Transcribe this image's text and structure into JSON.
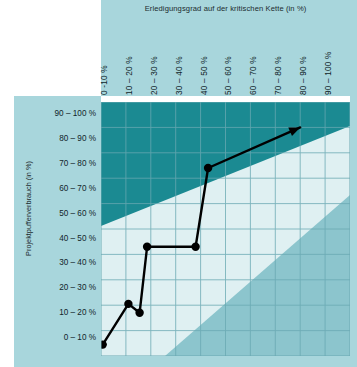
{
  "chart_data": {
    "type": "line",
    "title": "Erledigungsgrad auf der kritischen Kette (in %)",
    "xlabel": "Erledigungsgrad auf der kritischen Kette (in %)",
    "ylabel": "Projektpufferverbrauch (in %)",
    "grid": true,
    "legend": "none",
    "xlim": [
      0,
      100
    ],
    "ylim": [
      0,
      100
    ],
    "x_tick_labels": [
      "0 -10 %",
      "10 – 20 %",
      "20 – 30 %",
      "30 – 40 %",
      "40 – 50 %",
      "50 – 60 %",
      "60 – 70 %",
      "70 – 80 %",
      "80 – 90 %",
      "90 – 100 %"
    ],
    "y_tick_labels": [
      "90 – 100 %",
      "80 – 90 %",
      "70 – 80 %",
      "60 – 70 %",
      "50 – 60 %",
      "40 – 50 %",
      "30 – 40 %",
      "20 – 30 %",
      "10 – 20 %",
      "0 – 10 %"
    ],
    "series": [
      {
        "name": "Pufferverbrauch",
        "marker": "circle-filled",
        "arrow_end": true,
        "points": [
          {
            "x": 0.7,
            "y": 4.5
          },
          {
            "x": 11.0,
            "y": 20.5
          },
          {
            "x": 15.5,
            "y": 17.0
          },
          {
            "x": 18.5,
            "y": 43.0
          },
          {
            "x": 38.0,
            "y": 43.0
          },
          {
            "x": 43.0,
            "y": 74.0
          },
          {
            "x": 80.0,
            "y": 90.0
          }
        ]
      }
    ],
    "zones": [
      {
        "name": "kritisch",
        "color": "#1b8a92",
        "description": "oberer Bereich – Pufferverbrauch zu hoch"
      },
      {
        "name": "neutral",
        "color": "#dff0f2",
        "description": "mittlerer Bereich – Projekt im Plan"
      },
      {
        "name": "unkritisch",
        "color": "#8cc5cd",
        "description": "unterer Bereich – Pufferverbrauch unkritisch"
      }
    ]
  },
  "colors": {
    "band_background": "#a8d6dc",
    "zone_critical": "#1b8a92",
    "zone_neutral": "#dff0f2",
    "zone_safe": "#8cc5cd",
    "grid_line": "#6aa9b2",
    "series_line": "#000000",
    "text": "#11252a"
  }
}
